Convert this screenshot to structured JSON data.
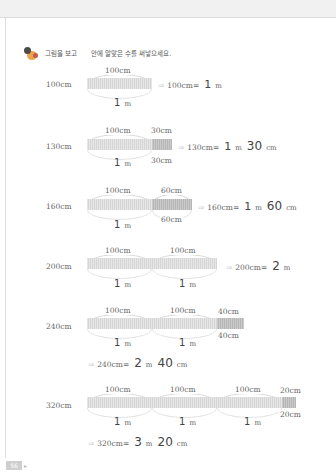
{
  "page": {
    "number": "56"
  },
  "instruction": {
    "part1": "그림을 보고",
    "part2": "안에 알맞은 수를 써넣으세요."
  },
  "rows": [
    {
      "label": "100cm",
      "top_labels": [
        "100cm"
      ],
      "bottom_labels": [
        {
          "value": "1",
          "unit": "m"
        }
      ],
      "equation": {
        "lhs": "100cm=",
        "answers": [
          {
            "value": "1",
            "unit": "m"
          }
        ]
      }
    },
    {
      "label": "130cm",
      "top_labels": [
        "100cm",
        "30cm"
      ],
      "bottom_labels": [
        {
          "value": "1",
          "unit": "m"
        }
      ],
      "remainder_bottom": "30cm",
      "equation": {
        "lhs": "130cm=",
        "answers": [
          {
            "value": "1",
            "unit": "m"
          },
          {
            "value": "30",
            "unit": "cm"
          }
        ]
      }
    },
    {
      "label": "160cm",
      "top_labels": [
        "100cm",
        "60cm"
      ],
      "bottom_labels": [
        {
          "value": "1",
          "unit": "m"
        }
      ],
      "remainder_bottom": "60cm",
      "equation": {
        "lhs": "160cm=",
        "answers": [
          {
            "value": "1",
            "unit": "m"
          },
          {
            "value": "60",
            "unit": "cm"
          }
        ]
      }
    },
    {
      "label": "200cm",
      "top_labels": [
        "100cm",
        "100cm"
      ],
      "bottom_labels": [
        {
          "value": "1",
          "unit": "m"
        },
        {
          "value": "1",
          "unit": "m"
        }
      ],
      "equation": {
        "lhs": "200cm=",
        "answers": [
          {
            "value": "2",
            "unit": "m"
          }
        ]
      }
    },
    {
      "label": "240cm",
      "top_labels": [
        "100cm",
        "100cm",
        "40cm"
      ],
      "bottom_labels": [
        {
          "value": "1",
          "unit": "m"
        },
        {
          "value": "1",
          "unit": "m"
        }
      ],
      "remainder_bottom": "40cm",
      "equation": {
        "lhs": "240cm=",
        "answers": [
          {
            "value": "2",
            "unit": "m"
          },
          {
            "value": "40",
            "unit": "cm"
          }
        ]
      }
    },
    {
      "label": "320cm",
      "top_labels": [
        "100cm",
        "100cm",
        "100cm",
        "20cm"
      ],
      "bottom_labels": [
        {
          "value": "1",
          "unit": "m"
        },
        {
          "value": "1",
          "unit": "m"
        },
        {
          "value": "1",
          "unit": "m"
        }
      ],
      "remainder_bottom": "20cm",
      "equation": {
        "lhs": "320cm=",
        "answers": [
          {
            "value": "3",
            "unit": "m"
          },
          {
            "value": "20",
            "unit": "cm"
          }
        ]
      }
    }
  ],
  "symbols": {
    "arrow": "⇒"
  }
}
